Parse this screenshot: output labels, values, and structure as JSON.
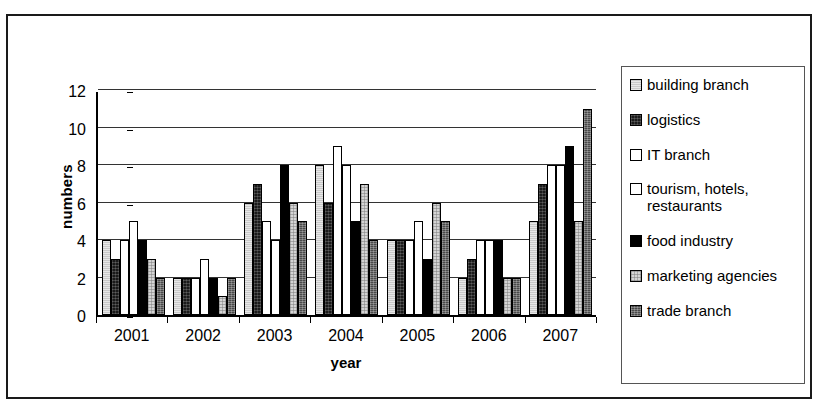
{
  "figure": {
    "ylabel": "numbers",
    "xlabel": "year"
  },
  "legend": {
    "items": [
      {
        "label": "building branch",
        "fill": "#c9c9c9",
        "pattern": "light-gray"
      },
      {
        "label": "logistics",
        "fill": "#1a1a1a",
        "pattern": "dark-speckled"
      },
      {
        "label": "IT branch",
        "fill": "#ffffff",
        "pattern": "white"
      },
      {
        "label": "tourism, hotels,\nrestaurants",
        "fill": "#ffffff",
        "pattern": "white"
      },
      {
        "label": "food industry",
        "fill": "#000000",
        "pattern": "solid-black"
      },
      {
        "label": "marketing agencies",
        "fill": "#d4d4d4",
        "pattern": "light-dotted"
      },
      {
        "label": "trade branch",
        "fill": "#4a4a4a",
        "pattern": "dark-textured"
      }
    ]
  },
  "chart_data": {
    "type": "bar",
    "title": "",
    "xlabel": "year",
    "ylabel": "numbers",
    "ylim": [
      0,
      12
    ],
    "yticks": [
      0,
      2,
      4,
      6,
      8,
      10,
      12
    ],
    "grid": true,
    "legend_position": "right",
    "categories": [
      "2001",
      "2002",
      "2003",
      "2004",
      "2005",
      "2006",
      "2007"
    ],
    "series": [
      {
        "name": "building branch",
        "values": [
          4,
          2,
          6,
          8,
          4,
          2,
          5
        ]
      },
      {
        "name": "logistics",
        "values": [
          3,
          2,
          7,
          6,
          4,
          3,
          7
        ]
      },
      {
        "name": "IT branch",
        "values": [
          4,
          2,
          5,
          9,
          4,
          4,
          8
        ]
      },
      {
        "name": "tourism, hotels, restaurants",
        "values": [
          5,
          3,
          4,
          8,
          5,
          4,
          8
        ]
      },
      {
        "name": "food industry",
        "values": [
          4,
          2,
          8,
          5,
          3,
          4,
          9
        ]
      },
      {
        "name": "marketing agencies",
        "values": [
          3,
          1,
          6,
          7,
          6,
          2,
          5
        ]
      },
      {
        "name": "trade branch",
        "values": [
          2,
          2,
          5,
          4,
          5,
          2,
          11
        ]
      }
    ]
  }
}
